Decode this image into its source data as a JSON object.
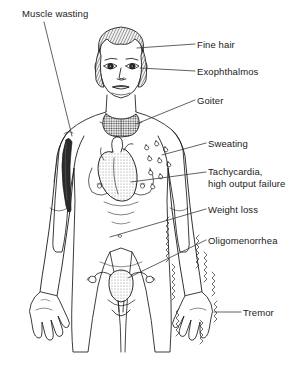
{
  "figure": {
    "background_color": "#ffffff",
    "ink_color": "#1a1a1a",
    "width": 301,
    "height": 371
  },
  "labels": {
    "muscle_wasting": "Muscle wasting",
    "fine_hair": "Fine hair",
    "exophthalmos": "Exophthalmos",
    "goiter": "Goiter",
    "sweating": "Sweating",
    "tachycardia_line1": "Tachycardia,",
    "tachycardia_line2": "high output failure",
    "weight_loss": "Weight loss",
    "oligomenorrhea": "Oligomenorrhea",
    "tremor": "Tremor"
  },
  "annotations": [
    {
      "id": "muscle-wasting",
      "text": "Muscle wasting",
      "side": "left",
      "target": "left-upper-arm"
    },
    {
      "id": "fine-hair",
      "text": "Fine hair",
      "side": "right",
      "target": "scalp-hair"
    },
    {
      "id": "exophthalmos",
      "text": "Exophthalmos",
      "side": "right",
      "target": "right-eye"
    },
    {
      "id": "goiter",
      "text": "Goiter",
      "side": "right",
      "target": "thyroid-gland"
    },
    {
      "id": "sweating",
      "text": "Sweating",
      "side": "right",
      "target": "sweat-droplets"
    },
    {
      "id": "tachycardia",
      "text": "Tachycardia, high output failure",
      "side": "right",
      "target": "heart"
    },
    {
      "id": "weight-loss",
      "text": "Weight loss",
      "side": "right",
      "target": "abdomen"
    },
    {
      "id": "oligomenorrhea",
      "text": "Oligomenorrhea",
      "side": "right",
      "target": "uterus"
    },
    {
      "id": "tremor",
      "text": "Tremor",
      "side": "right",
      "target": "right-hand"
    }
  ],
  "anatomy": {
    "figure_type": "female-anterior-whole-body",
    "shaded_structures": [
      "thyroid-goiter",
      "heart",
      "uterus-ovaries",
      "wasted-upper-arm-muscle"
    ],
    "sweat_droplet_count": 9,
    "tremor_indicator": "zigzag-vibration-lines-around-right-hand-and-forearm"
  }
}
